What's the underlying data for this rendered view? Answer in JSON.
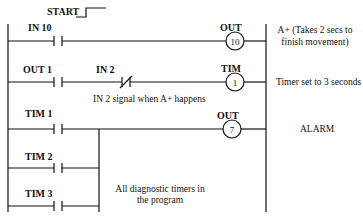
{
  "diagram": {
    "start_label": "START",
    "rungs": [
      {
        "contacts": [
          {
            "label": "IN 10",
            "type": "normally-open"
          }
        ],
        "coil": {
          "type": "OUT",
          "number": "10"
        },
        "note": "A+ (Takes 2 secs to",
        "note_line2": "finish movement)"
      },
      {
        "contacts": [
          {
            "label": "OUT 1",
            "type": "normally-open"
          },
          {
            "label": "IN 2",
            "type": "normally-closed"
          }
        ],
        "coil": {
          "type": "TIM",
          "number": "1"
        },
        "note": "Timer set to 3 seconds",
        "sub_note": "IN 2 signal when A+ happens"
      },
      {
        "contacts": [
          {
            "label": "TIM 1",
            "type": "normally-open"
          },
          {
            "label": "TIM 2",
            "type": "normally-open"
          },
          {
            "label": "TIM 3",
            "type": "normally-open"
          }
        ],
        "coil": {
          "type": "OUT",
          "number": "7"
        },
        "note": "ALARM",
        "sub_note": "All diagnostic timers in",
        "sub_note_line2": "the program"
      }
    ]
  }
}
